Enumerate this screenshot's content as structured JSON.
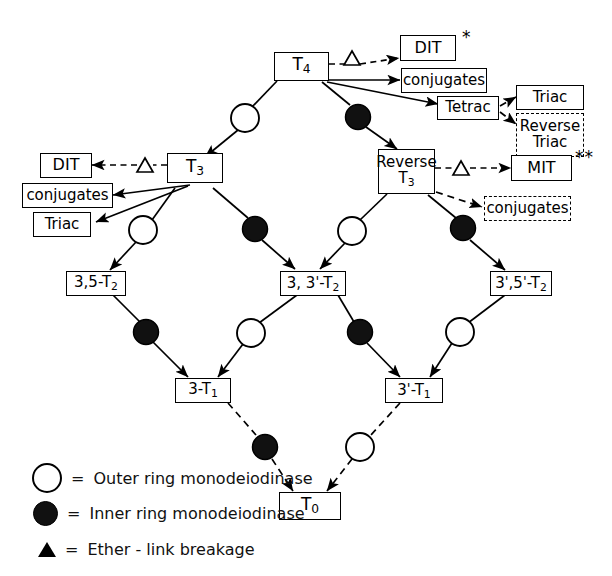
{
  "diagram": {
    "nodes": {
      "t4": {
        "label": "T4",
        "text": "T",
        "sub": "4"
      },
      "dit_top": {
        "label": "DIT"
      },
      "conj_top": {
        "label": "conjugates"
      },
      "tetrac": {
        "label": "Tetrac"
      },
      "triac_r": {
        "label": "Triac"
      },
      "rev_triac": {
        "label": "Reverse Triac",
        "line1": "Reverse",
        "line2": "Triac"
      },
      "t3": {
        "label": "T3",
        "text": "T",
        "sub": "3"
      },
      "dit_left": {
        "label": "DIT"
      },
      "conj_left": {
        "label": "conjugates"
      },
      "triac_l": {
        "label": "Triac"
      },
      "rt3": {
        "label": "Reverse T3",
        "line1": "Reverse",
        "line2": "T3"
      },
      "mit": {
        "label": "MIT"
      },
      "conj_rt3": {
        "label": "conjugates"
      },
      "t2_35": {
        "label": "3,5-T2"
      },
      "t2_33": {
        "label": "3, 3'-T2"
      },
      "t2_3555": {
        "label": "3',5'-T2"
      },
      "t1_3": {
        "label": "3-T1"
      },
      "t1_3p": {
        "label": "3'-T1"
      },
      "t0": {
        "label": "T0",
        "text": "T",
        "sub": "0"
      }
    },
    "markers": {
      "star_single": "*",
      "star_double": "**",
      "triangle": "△"
    },
    "legend": [
      {
        "glyph": "open-circle",
        "equals": "=",
        "text": "Outer ring monodeiodinase"
      },
      {
        "glyph": "filled-circle",
        "equals": "=",
        "text": "Inner ring monodeiodinase"
      },
      {
        "glyph": "triangle",
        "equals": "=",
        "text": "Ether - link breakage"
      }
    ],
    "enzyme_nodes": [
      {
        "type": "outer",
        "x": 245,
        "y": 118
      },
      {
        "type": "inner",
        "x": 358,
        "y": 117
      },
      {
        "type": "outer",
        "x": 143,
        "y": 230
      },
      {
        "type": "inner",
        "x": 255,
        "y": 229
      },
      {
        "type": "outer",
        "x": 352,
        "y": 231
      },
      {
        "type": "inner",
        "x": 463,
        "y": 228
      },
      {
        "type": "inner",
        "x": 146,
        "y": 332
      },
      {
        "type": "outer",
        "x": 251,
        "y": 333
      },
      {
        "type": "inner",
        "x": 360,
        "y": 332
      },
      {
        "type": "outer",
        "x": 460,
        "y": 332
      },
      {
        "type": "inner",
        "x": 265,
        "y": 447
      },
      {
        "type": "outer",
        "x": 360,
        "y": 447
      }
    ],
    "colors": {
      "ink": "#000000",
      "paper": "#ffffff",
      "inner_fill": "#111111",
      "outer_fill": "#ffffff"
    }
  }
}
